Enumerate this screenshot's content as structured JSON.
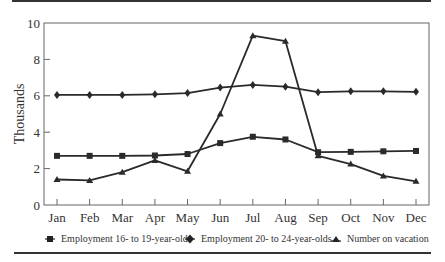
{
  "chart_data": {
    "type": "line",
    "title": "",
    "xlabel": "",
    "ylabel": "Thousands",
    "ylim": [
      0,
      10
    ],
    "yticks": [
      0,
      2,
      4,
      6,
      8,
      10
    ],
    "grid": false,
    "legend_position": "bottom",
    "categories": [
      "Jan",
      "Feb",
      "Mar",
      "Apr",
      "May",
      "Jun",
      "Jul",
      "Aug",
      "Sep",
      "Oct",
      "Nov",
      "Dec"
    ],
    "series": [
      {
        "name": "Employment 16- to 19-year-olds",
        "marker": "square",
        "values": [
          2.7,
          2.7,
          2.7,
          2.72,
          2.8,
          3.4,
          3.75,
          3.6,
          2.9,
          2.92,
          2.95,
          2.97
        ]
      },
      {
        "name": "Employment 20- to 24-year-olds",
        "marker": "diamond",
        "values": [
          6.05,
          6.05,
          6.05,
          6.08,
          6.15,
          6.45,
          6.6,
          6.5,
          6.2,
          6.25,
          6.25,
          6.22
        ]
      },
      {
        "name": "Number on vacation",
        "marker": "triangle",
        "values": [
          1.4,
          1.35,
          1.8,
          2.45,
          1.85,
          5.0,
          9.3,
          9.0,
          2.7,
          2.25,
          1.6,
          1.3
        ]
      }
    ]
  },
  "axis": {
    "ylabel": "Thousands",
    "yticks": [
      "0",
      "2",
      "4",
      "6",
      "8",
      "10"
    ],
    "xticks": [
      "Jan",
      "Feb",
      "Mar",
      "Apr",
      "May",
      "Jun",
      "Jul",
      "Aug",
      "Sep",
      "Oct",
      "Nov",
      "Dec"
    ]
  },
  "legend": {
    "items": [
      {
        "label": "Employment 16- to 19-year-olds",
        "marker": "square"
      },
      {
        "label": "Employment 20- to 24-year-olds",
        "marker": "diamond"
      },
      {
        "label": "Number on vacation",
        "marker": "triangle"
      }
    ]
  },
  "colors": {
    "line": "#2a2a2a",
    "frame": "#555555",
    "rule": "#333333"
  }
}
